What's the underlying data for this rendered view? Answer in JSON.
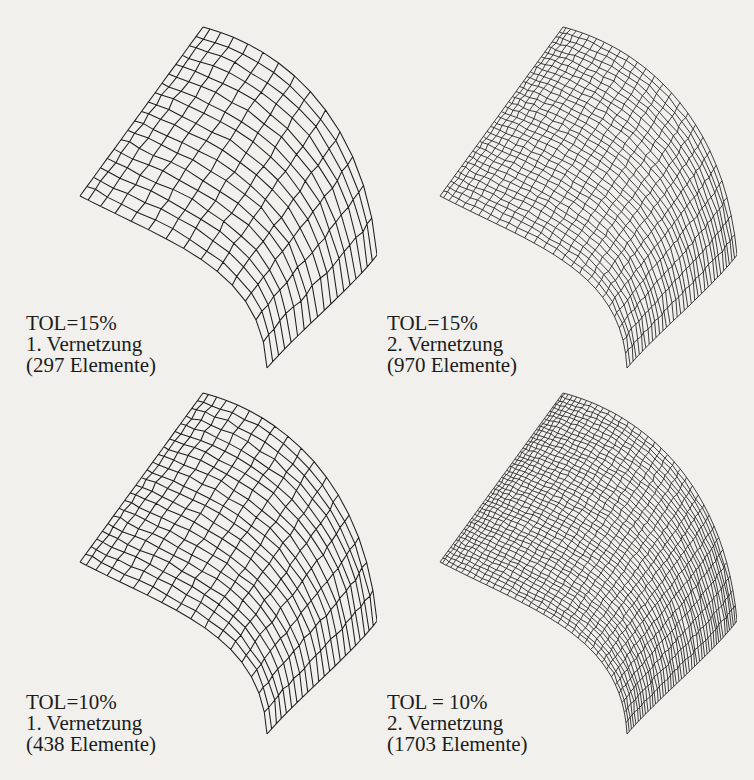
{
  "figure": {
    "background": "#f1f0ec",
    "line_color": "#1e1e1e",
    "panels": [
      {
        "id": "tol15-first",
        "tolerance": "TOL=15%",
        "step": "1. Vernetzung",
        "elements": "(297 Elemente)",
        "element_count": 297,
        "grid": {
          "nu": 14,
          "nv": 18
        },
        "offset": [
          0,
          0
        ],
        "caption_pos": [
          26,
          313
        ]
      },
      {
        "id": "tol15-second",
        "tolerance": "TOL=15%",
        "step": "2. Vernetzung",
        "elements": "(970 Elemente)",
        "element_count": 970,
        "grid": {
          "nu": 26,
          "nv": 34
        },
        "offset": [
          360,
          0
        ],
        "caption_pos": [
          387,
          313
        ]
      },
      {
        "id": "tol10-first",
        "tolerance": "TOL=10%",
        "step": "1. Vernetzung",
        "elements": "(438 Elemente)",
        "element_count": 438,
        "grid": {
          "nu": 17,
          "nv": 22
        },
        "offset": [
          0,
          366
        ],
        "caption_pos": [
          26,
          692
        ]
      },
      {
        "id": "tol10-second",
        "tolerance": "TOL = 10%",
        "step": "2. Vernetzung",
        "elements": "(1703 Elemente)",
        "element_count": 1703,
        "grid": {
          "nu": 34,
          "nv": 46
        },
        "offset": [
          360,
          366
        ],
        "caption_pos": [
          387,
          692
        ]
      }
    ]
  }
}
